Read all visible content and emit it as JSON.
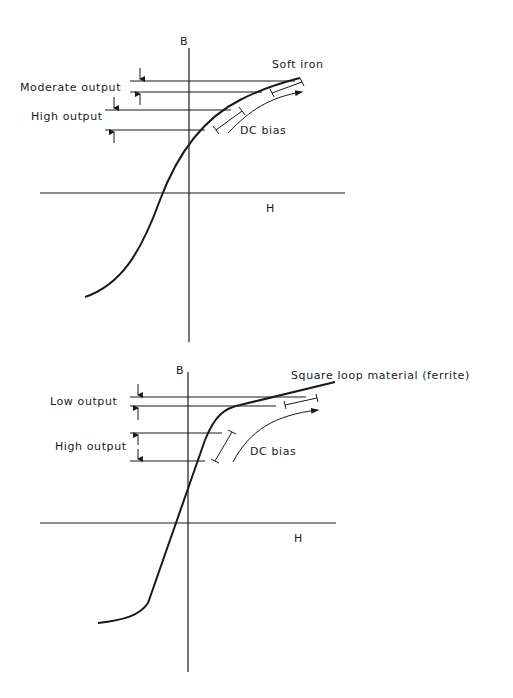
{
  "diagrams": [
    {
      "id": "soft-iron",
      "axis_labels": {
        "y": "B",
        "x": "H"
      },
      "material_label": "Soft iron",
      "bands": [
        {
          "label": "Moderate output"
        },
        {
          "label": "High output"
        }
      ],
      "bias_label": "DC bias"
    },
    {
      "id": "ferrite",
      "axis_labels": {
        "y": "B",
        "x": "H"
      },
      "material_label": "Square loop material (ferrite)",
      "bands": [
        {
          "label": "Low output"
        },
        {
          "label": "High output"
        }
      ],
      "bias_label": "DC bias"
    }
  ]
}
